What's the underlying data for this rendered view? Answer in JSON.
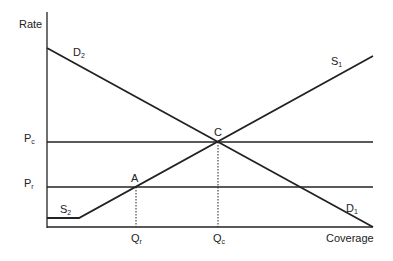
{
  "diagram": {
    "title": "",
    "axes": {
      "y_label": "Rate",
      "x_label": "Coverage"
    },
    "curves": {
      "D2": {
        "base": "D",
        "sub": "2"
      },
      "D1": {
        "base": "D",
        "sub": "1"
      },
      "S1": {
        "base": "S",
        "sub": "1"
      },
      "S2": {
        "base": "S",
        "sub": "2"
      }
    },
    "price_levels": {
      "Pc": {
        "base": "P",
        "sub": "c"
      },
      "Pr": {
        "base": "P",
        "sub": "r"
      }
    },
    "quantities": {
      "Qr": {
        "base": "Q",
        "sub": "r"
      },
      "Qc": {
        "base": "Q",
        "sub": "c"
      }
    },
    "points": {
      "A": "A",
      "C": "C"
    },
    "line_color": "#222222"
  }
}
